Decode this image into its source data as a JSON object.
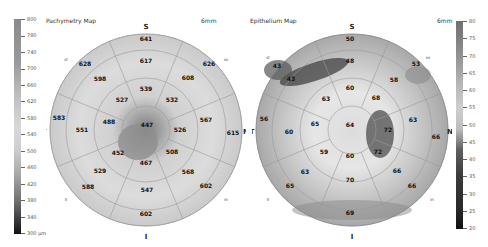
{
  "pachymetry": {
    "title": "Pachymetry Map",
    "diameter_label": "6mm",
    "scale": {
      "ticks": [
        "800",
        "780",
        "740",
        "700",
        "660",
        "620",
        "580",
        "540",
        "500",
        "460",
        "420",
        "380",
        "340",
        "300 µm"
      ],
      "top_color": "#8a8a8a",
      "bottom_color": "#111111"
    },
    "orientation": {
      "superior": "S",
      "inferior": "I",
      "temporal": "T",
      "nasal": "N",
      "st": "st",
      "sn": "sn",
      "it": "it",
      "in": "in"
    },
    "values": {
      "center": "447",
      "inner": {
        "s": "539",
        "sn": "532",
        "n": "526",
        "in": "508",
        "i": "467",
        "it": "452",
        "t": "488",
        "st": "527"
      },
      "middle": {
        "s": "617",
        "sn": "608",
        "n": "567",
        "in": "568",
        "i": "547",
        "it": "529",
        "t": "551",
        "st": "598"
      },
      "outer": {
        "s": "641",
        "sn": "626",
        "n": "615",
        "in": "602",
        "i": "602",
        "it": "588",
        "t": "583",
        "st": "628"
      }
    }
  },
  "epithelium": {
    "title": "Epithelium Map",
    "diameter_label": "6mm",
    "scale": {
      "ticks": [
        "80",
        "75",
        "70",
        "65",
        "60",
        "55",
        "50",
        "45",
        "40",
        "35",
        "30",
        "25",
        "20"
      ],
      "top_color": "#777777",
      "bottom_color": "#111111"
    },
    "orientation": {
      "superior": "S",
      "inferior": "I",
      "temporal": "T",
      "nasal": "N",
      "st": "st",
      "sn": "sn",
      "it": "it",
      "in": "in"
    },
    "values": {
      "center": "64",
      "inner": {
        "s": "60",
        "sn": "68",
        "n": "72",
        "in": "72",
        "i": "60",
        "it": "59",
        "t": "65",
        "st": "63"
      },
      "middle": {
        "s": "48",
        "sn": "58",
        "n": "63",
        "in": "66",
        "i": "70",
        "it": "63",
        "t": "60",
        "st": "43"
      },
      "outer": {
        "s": "50",
        "sn": "53",
        "n": "66",
        "in": "66",
        "i": "69",
        "it": "65",
        "t": "56",
        "st": "43"
      }
    }
  }
}
